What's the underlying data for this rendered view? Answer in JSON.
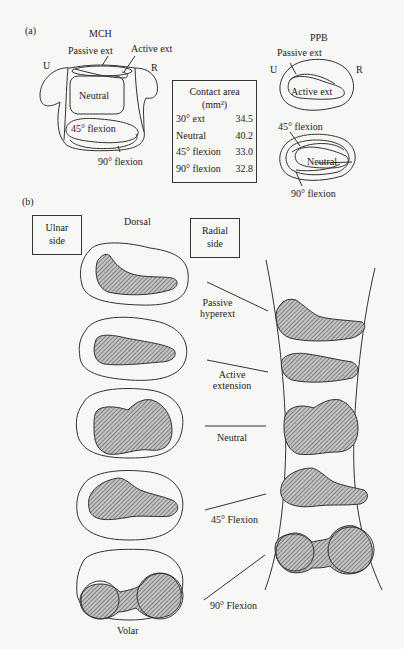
{
  "panel_a": {
    "label": "(a)",
    "mch": {
      "title": "MCH",
      "ulnar": "U",
      "radial": "R",
      "passive_ext": "Passive ext",
      "active_ext": "Active ext",
      "neutral": "Neutral",
      "flex45": "45° flexion",
      "flex90": "90° flexion"
    },
    "table": {
      "title_line1": "Contact area",
      "title_line2": "(mm²)",
      "rows": [
        {
          "label": "30° ext",
          "value": "34.5"
        },
        {
          "label": "Neutral",
          "value": "40.2"
        },
        {
          "label": "45° flexion",
          "value": "33.0"
        },
        {
          "label": "90° flexion",
          "value": "32.8"
        }
      ]
    },
    "ppb": {
      "title": "PPB",
      "ulnar": "U",
      "radial": "R",
      "passive_ext": "Passive ext",
      "active_ext": "Active ext",
      "flex45": "45° flexion",
      "neutral": "Neutral",
      "flex90": "90° flexion"
    }
  },
  "panel_b": {
    "label": "(b)",
    "ulnar_box": {
      "line1": "Ulnar",
      "line2": "side"
    },
    "radial_box": {
      "line1": "Radial",
      "line2": "side"
    },
    "dorsal": "Dorsal",
    "volar": "Volar",
    "positions": [
      {
        "line1": "Passive",
        "line2": "hyperext"
      },
      {
        "line1": "Active",
        "line2": "extension"
      },
      {
        "line1": "Neutral",
        "line2": ""
      },
      {
        "line1": "45° Flexion",
        "line2": ""
      },
      {
        "line1": "90° Flexion",
        "line2": ""
      }
    ]
  },
  "colors": {
    "line": "#333333",
    "hatch": "#555555",
    "fill": "#bdbdbd",
    "background": "#f7f7f5"
  }
}
